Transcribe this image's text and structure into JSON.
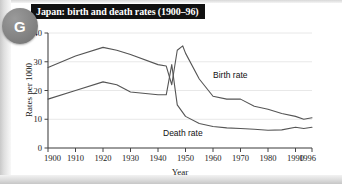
{
  "badge": {
    "letter": "G",
    "name": "figure-badge"
  },
  "figure": {
    "title": "Japan: birth and death rates (1900–96)"
  },
  "chart_data": {
    "type": "line",
    "title": "Japan: birth and death rates (1900–96)",
    "xlabel": "Year",
    "ylabel": "Rates per 1000",
    "xlim": [
      1900,
      1996
    ],
    "ylim": [
      0,
      40
    ],
    "grid": true,
    "legend": "inline-labels",
    "xticks": [
      1900,
      1910,
      1920,
      1930,
      1940,
      1950,
      1960,
      1970,
      1980,
      1990,
      1996
    ],
    "xticklabels": [
      "1900",
      "1910",
      "1920",
      "1930",
      "1940",
      "1950",
      "1960",
      "1970",
      "1980",
      "1990",
      "1996"
    ],
    "yticks": [
      0,
      10,
      20,
      30,
      40
    ],
    "yticklabels": [
      "0",
      "10",
      "20",
      "30",
      "40"
    ],
    "series": [
      {
        "name": "Birth rate",
        "label": "Birth rate",
        "color": "#555555",
        "x": [
          1900,
          1910,
          1920,
          1925,
          1930,
          1940,
          1943,
          1945,
          1947,
          1949,
          1950,
          1955,
          1960,
          1965,
          1970,
          1975,
          1980,
          1985,
          1990,
          1993,
          1996
        ],
        "values": [
          28.0,
          32.0,
          35.0,
          34.0,
          32.5,
          29.0,
          28.5,
          22.0,
          34.0,
          35.5,
          33.0,
          24.0,
          18.0,
          17.0,
          17.0,
          14.5,
          13.5,
          12.0,
          11.0,
          10.0,
          10.5
        ]
      },
      {
        "name": "Death rate",
        "label": "Death rate",
        "color": "#555555",
        "x": [
          1900,
          1910,
          1920,
          1925,
          1930,
          1940,
          1943,
          1945,
          1947,
          1950,
          1955,
          1960,
          1965,
          1970,
          1975,
          1980,
          1985,
          1990,
          1993,
          1996
        ],
        "values": [
          17.0,
          20.0,
          23.0,
          22.0,
          19.5,
          18.5,
          18.5,
          29.0,
          15.0,
          11.0,
          8.5,
          7.5,
          7.0,
          6.8,
          6.5,
          6.2,
          6.3,
          7.2,
          6.8,
          7.2
        ]
      }
    ]
  }
}
